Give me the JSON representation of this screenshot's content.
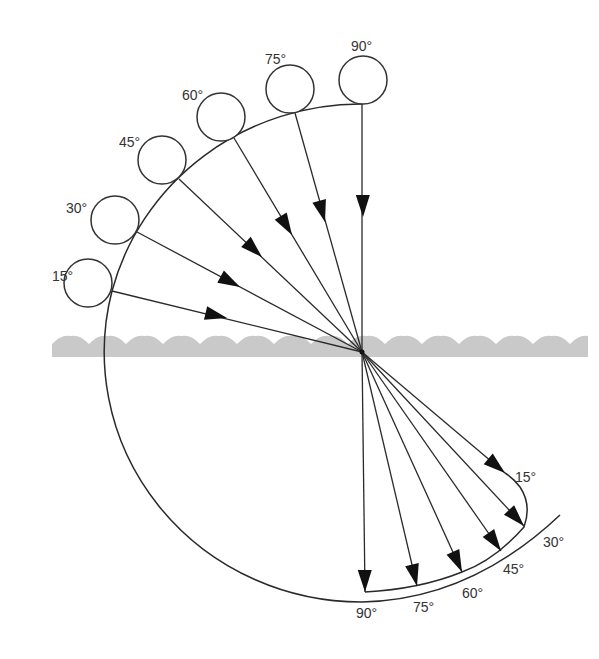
{
  "diagram": {
    "center": {
      "x": 362,
      "y": 352
    },
    "colors": {
      "line": "#2a2a2a",
      "arrowhead": "#111111",
      "water": "#c9c9c9",
      "label": "#333333"
    },
    "water": {
      "x_start": 52,
      "x_end": 588,
      "y_top": 337,
      "y_bottom": 357,
      "wave_period": 37
    },
    "incident_rays": [
      {
        "label": "15°",
        "ball": {
          "cx": 88,
          "cy": 283,
          "r": 24
        },
        "contact": {
          "x": 112,
          "y": 291
        },
        "arrow_tip": {
          "x": 227,
          "y": 318
        },
        "label_pos": {
          "x": 52,
          "y": 281
        }
      },
      {
        "label": "30°",
        "ball": {
          "cx": 115,
          "cy": 220,
          "r": 24
        },
        "contact": {
          "x": 137,
          "y": 232
        },
        "arrow_tip": {
          "x": 240,
          "y": 287
        },
        "label_pos": {
          "x": 66,
          "y": 213
        }
      },
      {
        "label": "45°",
        "ball": {
          "cx": 162,
          "cy": 160,
          "r": 24
        },
        "contact": {
          "x": 179,
          "y": 179
        },
        "arrow_tip": {
          "x": 262,
          "y": 257
        },
        "label_pos": {
          "x": 119,
          "y": 147
        }
      },
      {
        "label": "60°",
        "ball": {
          "cx": 221,
          "cy": 117,
          "r": 24
        },
        "contact": {
          "x": 234,
          "y": 138
        },
        "arrow_tip": {
          "x": 292,
          "y": 235
        },
        "label_pos": {
          "x": 182,
          "y": 100
        }
      },
      {
        "label": "75°",
        "ball": {
          "cx": 290,
          "cy": 89,
          "r": 24
        },
        "contact": {
          "x": 295,
          "y": 113
        },
        "arrow_tip": {
          "x": 325,
          "y": 222
        },
        "label_pos": {
          "x": 265,
          "y": 64
        }
      },
      {
        "label": "90°",
        "ball": {
          "cx": 363,
          "cy": 80,
          "r": 24
        },
        "contact": {
          "x": 362,
          "y": 104
        },
        "arrow_tip": {
          "x": 363,
          "y": 217
        },
        "label_pos": {
          "x": 351,
          "y": 51
        }
      }
    ],
    "refracted_rays": [
      {
        "label": "15°",
        "end": {
          "x": 505,
          "y": 473
        },
        "label_pos": {
          "x": 515,
          "y": 482
        }
      },
      {
        "label": "30°",
        "end": {
          "x": 524,
          "y": 526
        },
        "label_pos": {
          "x": 543,
          "y": 547
        }
      },
      {
        "label": "45°",
        "end": {
          "x": 501,
          "y": 551
        },
        "label_pos": {
          "x": 503,
          "y": 574
        }
      },
      {
        "label": "60°",
        "end": {
          "x": 462,
          "y": 572
        },
        "label_pos": {
          "x": 462,
          "y": 598
        }
      },
      {
        "label": "75°",
        "end": {
          "x": 417,
          "y": 586
        },
        "label_pos": {
          "x": 413,
          "y": 612
        }
      },
      {
        "label": "90°",
        "end": {
          "x": 365,
          "y": 592
        },
        "label_pos": {
          "x": 356,
          "y": 618
        }
      }
    ],
    "upper_arc_label": "incident angle arc",
    "lower_curve_label": "refraction locus"
  }
}
